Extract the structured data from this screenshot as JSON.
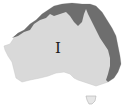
{
  "map": {
    "region": "Australia",
    "colors": {
      "background": "#ffffff",
      "land": "#d9d9d9",
      "zone_dark": "#6e6e6e",
      "outline": "#a0a0a0",
      "label": "#1a1a1a"
    },
    "zones": [
      {
        "name": "coastal-band-north-east",
        "shade": "dark"
      },
      {
        "name": "interior",
        "shade": "light"
      }
    ],
    "labels": [
      {
        "text": "I",
        "x": 55,
        "y": 41
      }
    ]
  }
}
